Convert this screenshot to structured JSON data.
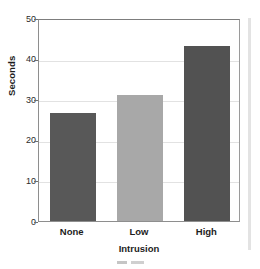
{
  "chart_data": {
    "type": "bar",
    "title": "",
    "categories": [
      "None",
      "Low",
      "High"
    ],
    "values": [
      26.5,
      31,
      43
    ],
    "xlabel": "Intrusion",
    "ylabel": "Seconds",
    "ylim": [
      0,
      50
    ],
    "yticks": [
      0,
      10,
      20,
      30,
      40,
      50
    ],
    "ytick_labels": [
      "0",
      "10",
      "20",
      "30",
      "40",
      "50"
    ],
    "grid": true,
    "grid_axis": "y",
    "legend": false,
    "bar_colors": [
      "#585858",
      "#a8a8a8",
      "#525252"
    ],
    "series": [
      {
        "name": "Seconds",
        "points": [
          {
            "category": "None",
            "value": 26.5,
            "color": "#585858"
          },
          {
            "category": "Low",
            "value": 31,
            "color": "#a8a8a8"
          },
          {
            "category": "High",
            "value": 43,
            "color": "#525252"
          }
        ]
      }
    ]
  },
  "style": {
    "frame_color": "#8e8e8e",
    "gridline_color": "#e2e2e2",
    "text_color": "#1d1d1d",
    "background": "#ffffff"
  }
}
